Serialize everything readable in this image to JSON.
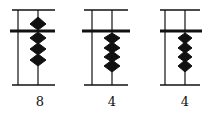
{
  "diagram": {
    "type": "abacus",
    "columns": [
      {
        "value": "8",
        "upper_beads": 1,
        "lower_beads": 3
      },
      {
        "value": "4",
        "upper_beads": 0,
        "lower_beads": 4
      },
      {
        "value": "4",
        "upper_beads": 0,
        "lower_beads": 4
      }
    ],
    "colors": {
      "ink": "#111111",
      "background": "#ffffff"
    }
  }
}
